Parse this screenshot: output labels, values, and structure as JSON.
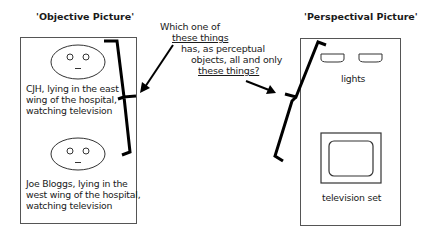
{
  "objective": {
    "title": "'Objective Picture'",
    "persons": [
      {
        "label_lines": [
          "CJH, lying in the east",
          "wing of the hospital,",
          "watching television"
        ]
      },
      {
        "label_lines": [
          "Joe Bloggs, lying in the",
          "west wing of the hospital,",
          "watching television"
        ]
      }
    ]
  },
  "perspectival": {
    "title": "'Perspectival Picture'",
    "lights_label": "lights",
    "tv_label": "television set"
  },
  "question": {
    "line1": "Which one of",
    "line2": "these things",
    "line3": "has, as perceptual",
    "line4": "objects, all and only",
    "line5": "these things?"
  }
}
